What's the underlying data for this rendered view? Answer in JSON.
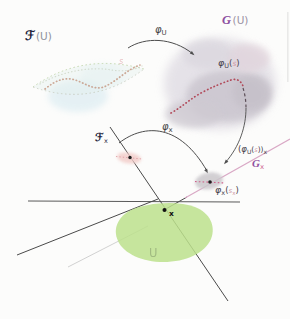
{
  "figure": {
    "background": "#fcfcfb"
  },
  "colors": {
    "ink": "#4a4a4a",
    "navy_script": "#23233a",
    "purple_script": "#8d4f9f",
    "pink_sub": "#d06a94",
    "lilac_stalk_line": "#d9a8c5",
    "red_dotted_curve": "#b24a5a",
    "tan_dotted_curve": "#c59a85",
    "green_region": "#bce18c",
    "gray_cloud": "#d6d2d9",
    "blue_wash": "#cfe6ee",
    "faint_section": "#cf9aa6"
  },
  "labels": {
    "F_U": {
      "script": "ℱ",
      "paren": "(U)"
    },
    "G_U": {
      "script": "G",
      "paren": "(U)"
    },
    "phi_U": {
      "phi": "φ",
      "sub": "U"
    },
    "phi_U_s": {
      "phi": "φ",
      "subU": "U",
      "open": "(",
      "s": "s",
      "close": ")"
    },
    "phi_x": {
      "phi": "φ",
      "sub": "x"
    },
    "phi_U_s_x": {
      "open": "(",
      "phi": "φ",
      "subU": "U",
      "open2": "(",
      "s": "s",
      "close2": "))",
      "subx": "x"
    },
    "G_x": {
      "script": "G",
      "sub": "x"
    },
    "phi_x_sx": {
      "phi": "φ",
      "subx": "x",
      "open": "(",
      "s": "s",
      "ssub": "x",
      "close": ")"
    },
    "F_x": {
      "script": "ℱ",
      "sub": "x"
    },
    "point_x": "x",
    "region_U": "U",
    "section_s": "s"
  }
}
